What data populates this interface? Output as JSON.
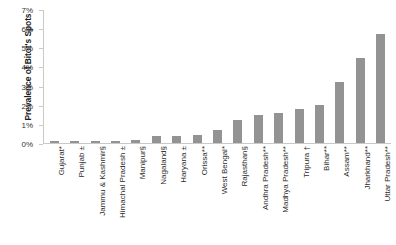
{
  "chart_data": {
    "type": "bar",
    "title": "",
    "xlabel": "",
    "ylabel": "Prevalence of Bitot's Spots",
    "ylim": [
      0,
      7
    ],
    "ytick_labels": [
      "7%",
      "6%",
      "5%",
      "4%",
      "3%",
      "2%",
      "1%",
      "0%"
    ],
    "ytick_values": [
      7,
      6,
      5,
      4,
      3,
      2,
      1,
      0
    ],
    "grid": false,
    "legend": null,
    "bar_color": "#939393",
    "axis_color": "#c9c9c9",
    "categories": [
      "Gujarat*",
      "Punjab ±",
      "Jammu & Kashmir§",
      "Himachal Pradesh ±",
      "Manipur§",
      "Nagaland§",
      "Haryana ±",
      "Orissa**",
      "West Bengal*",
      "Rajasthan§",
      "Andhra Pradesh**",
      "Madhya Pradesh**",
      "Tripura †",
      "Bihar**",
      "Assam**",
      "Jharkhand**",
      "Uttar Pradesh**"
    ],
    "values": [
      0.1,
      0.1,
      0.1,
      0.1,
      0.15,
      0.35,
      0.35,
      0.4,
      0.7,
      1.2,
      1.5,
      1.6,
      1.8,
      2.0,
      3.2,
      4.5,
      5.75
    ]
  }
}
